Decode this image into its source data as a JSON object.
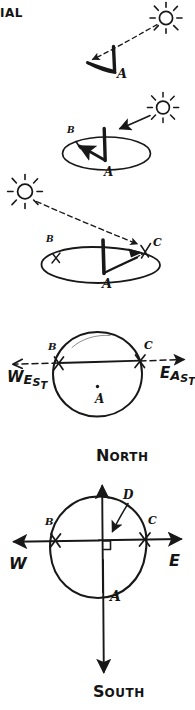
{
  "page": {
    "title_fragment": "IAL",
    "background_color": "#ffffff",
    "ink_color": "#181818",
    "width": 195,
    "height": 710
  },
  "figures": [
    {
      "id": "fig-1",
      "name": "gnomon-shadow-west-morning",
      "caption": "",
      "sun": {
        "name": "sun-upper-right",
        "cx": 166,
        "cy": 18,
        "r": 7
      },
      "ray": {
        "name": "sun-ray-dashed",
        "from": [
          158,
          25
        ],
        "to": [
          92,
          60
        ]
      },
      "points": [
        {
          "label": "A",
          "role": "stick-base",
          "x": 119,
          "y": 72
        }
      ]
    },
    {
      "id": "fig-2",
      "name": "dial-plate-shadow-to-b",
      "sun": {
        "name": "sun-upper-right",
        "cx": 163,
        "cy": 108,
        "r": 7
      },
      "ray": {
        "name": "sun-ray-solid-arrow",
        "from": [
          152,
          117
        ],
        "to": [
          115,
          129
        ]
      },
      "points": [
        {
          "label": "B",
          "role": "shadow-tip-west",
          "x": 70,
          "y": 131
        },
        {
          "label": "A",
          "role": "stick-base",
          "x": 106,
          "y": 172
        }
      ]
    },
    {
      "id": "fig-3",
      "name": "dial-plate-shadow-to-c",
      "sun": {
        "name": "sun-left",
        "cx": 25,
        "cy": 192,
        "r": 8
      },
      "ray": {
        "name": "sun-ray-dashed",
        "from": [
          38,
          203
        ],
        "to": [
          140,
          245
        ]
      },
      "points": [
        {
          "label": "B",
          "role": "mark-west",
          "x": 48,
          "y": 240
        },
        {
          "label": "C",
          "role": "shadow-tip-east",
          "x": 155,
          "y": 243
        },
        {
          "label": "A",
          "role": "stick-base",
          "x": 106,
          "y": 282
        }
      ]
    },
    {
      "id": "fig-4",
      "name": "plan-view-west-east-line",
      "points": [
        {
          "label": "B",
          "role": "mark-west",
          "x": 50,
          "y": 349
        },
        {
          "label": "C",
          "role": "mark-east",
          "x": 146,
          "y": 347
        },
        {
          "label": "A",
          "role": "center-dot",
          "x": 98,
          "y": 400
        }
      ],
      "cardinals": [
        {
          "label": "WEST",
          "name": "west-label",
          "x": 6,
          "y": 372
        },
        {
          "label": "EAST",
          "name": "east-label",
          "x": 158,
          "y": 368
        }
      ],
      "axis": {
        "name": "west-east-axis",
        "from": [
          8,
          364
        ],
        "to": [
          186,
          360
        ]
      }
    },
    {
      "id": "fig-5",
      "name": "plan-view-full-compass",
      "points": [
        {
          "label": "B",
          "role": "mark-west",
          "x": 47,
          "y": 523
        },
        {
          "label": "C",
          "role": "mark-east",
          "x": 150,
          "y": 522
        },
        {
          "label": "D",
          "role": "north-south-intersection",
          "x": 126,
          "y": 495
        },
        {
          "label": "A",
          "role": "center-region",
          "x": 113,
          "y": 597
        }
      ],
      "cardinals": [
        {
          "label": "NORTH",
          "name": "north-label",
          "x": 96,
          "y": 452
        },
        {
          "label": "SOUTH",
          "name": "south-label",
          "x": 95,
          "y": 688
        },
        {
          "label": "W",
          "name": "west-short-label",
          "x": 10,
          "y": 563
        },
        {
          "label": "E",
          "name": "east-short-label",
          "x": 170,
          "y": 560
        }
      ],
      "right_angle": {
        "name": "right-angle-mark",
        "x": 104,
        "y": 551
      }
    }
  ]
}
